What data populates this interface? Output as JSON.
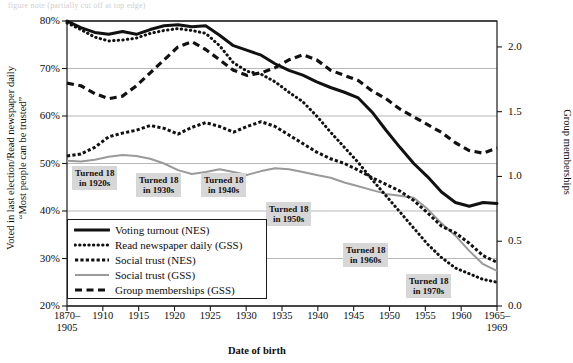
{
  "top_caption": "figure note (partially cut off at top edge)",
  "axes": {
    "left_label_line1": "Voted in last election/Read newspaper daily",
    "left_label_line2": "“Most people can be trusted”",
    "right_label": "Group memberships",
    "x_label": "Date of birth",
    "y_left_ticks": [
      "80%",
      "70%",
      "60%",
      "50%",
      "40%",
      "30%",
      "20%"
    ],
    "y_left_range": [
      20,
      80
    ],
    "y_right_ticks": [
      "2.0",
      "1.5",
      "1.0",
      "0.5",
      "0.0"
    ],
    "y_right_range": [
      0.0,
      2.2
    ],
    "x_ticks": [
      "1870–\n1905",
      "1910",
      "1915",
      "1920",
      "1925",
      "1930",
      "1935",
      "1940",
      "1945",
      "1950",
      "1955",
      "1960",
      "1965–\n1969"
    ]
  },
  "legend": {
    "items": [
      {
        "label": "Voting turnout (NES)",
        "style": "solid-thick",
        "color": "#111111"
      },
      {
        "label": "Read newspaper daily (GSS)",
        "style": "dotted",
        "color": "#111111"
      },
      {
        "label": "Social trust (NES)",
        "style": "dashed-short",
        "color": "#111111"
      },
      {
        "label": "Social trust (GSS)",
        "style": "solid-gray",
        "color": "#8d8d8d"
      },
      {
        "label": "Group memberships (GSS)",
        "style": "dashed-long",
        "color": "#111111"
      }
    ]
  },
  "annotations": [
    {
      "line1": "Turned 18",
      "line2": "in 1920s",
      "x": 72,
      "y": 166
    },
    {
      "line1": "Turned 18",
      "line2": "in 1930s",
      "x": 136,
      "y": 173
    },
    {
      "line1": "Turned 18",
      "line2": "in 1940s",
      "x": 201,
      "y": 173
    },
    {
      "line1": "Turned 18",
      "line2": "in 1950s",
      "x": 266,
      "y": 202
    },
    {
      "line1": "Turned 18",
      "line2": "in 1960s",
      "x": 343,
      "y": 243
    },
    {
      "line1": "Turned 18",
      "line2": "in 1970s",
      "x": 406,
      "y": 274
    }
  ],
  "chart_data": {
    "type": "line",
    "title": "",
    "xlabel": "Date of birth",
    "ylabel": "Voted in last election/Read newspaper daily; “Most people can be trusted”",
    "y2label": "Group memberships",
    "ylim": [
      20,
      80
    ],
    "y2lim": [
      0.0,
      2.2
    ],
    "grid": "horizontal",
    "legend_position": "inside-lower-left",
    "x": [
      1905,
      1907,
      1909,
      1911,
      1913,
      1915,
      1917,
      1919,
      1921,
      1923,
      1925,
      1927,
      1929,
      1931,
      1933,
      1935,
      1937,
      1939,
      1941,
      1943,
      1945,
      1947,
      1949,
      1951,
      1953,
      1955,
      1957,
      1959,
      1961,
      1963,
      1965,
      1967
    ],
    "series": [
      {
        "name": "Voting turnout (NES)",
        "axis": "left",
        "unit": "percent",
        "values": [
          80.0,
          78.6,
          77.6,
          77.2,
          77.8,
          77.2,
          78.2,
          79.0,
          79.2,
          78.8,
          79.0,
          77.0,
          74.8,
          73.8,
          72.8,
          71.0,
          69.6,
          68.6,
          67.2,
          66.0,
          65.0,
          63.8,
          60.8,
          57.0,
          53.4,
          50.0,
          47.2,
          44.0,
          41.8,
          41.0,
          41.8,
          41.6
        ]
      },
      {
        "name": "Read newspaper daily (GSS)",
        "axis": "left",
        "unit": "percent",
        "values": [
          79.6,
          78.2,
          76.6,
          75.8,
          76.0,
          76.4,
          77.4,
          78.0,
          78.4,
          78.0,
          77.4,
          74.8,
          71.2,
          69.4,
          68.8,
          67.2,
          65.0,
          63.0,
          60.0,
          56.6,
          53.4,
          50.2,
          46.6,
          43.2,
          39.8,
          36.4,
          33.0,
          30.2,
          28.0,
          26.8,
          25.6,
          25.0
        ]
      },
      {
        "name": "Social trust (NES)",
        "axis": "left",
        "unit": "percent",
        "values": [
          51.6,
          52.0,
          53.4,
          55.6,
          56.4,
          57.0,
          58.0,
          57.4,
          56.2,
          57.6,
          58.6,
          57.8,
          56.6,
          57.8,
          58.8,
          57.8,
          56.0,
          54.2,
          52.4,
          51.0,
          50.0,
          48.6,
          47.0,
          45.6,
          44.2,
          42.2,
          39.6,
          36.8,
          35.4,
          33.2,
          30.6,
          29.2
        ]
      },
      {
        "name": "Social trust (GSS)",
        "axis": "left",
        "unit": "percent",
        "values": [
          50.6,
          50.4,
          50.8,
          51.4,
          51.8,
          51.6,
          51.0,
          50.0,
          48.6,
          47.8,
          48.2,
          48.8,
          48.2,
          47.6,
          48.4,
          49.0,
          48.8,
          48.2,
          47.6,
          47.0,
          46.0,
          45.2,
          44.4,
          43.6,
          43.2,
          42.8,
          40.4,
          37.4,
          34.8,
          31.6,
          28.8,
          27.4
        ]
      },
      {
        "name": "Group memberships (GSS)",
        "axis": "right",
        "unit": "memberships",
        "values": [
          1.72,
          1.7,
          1.64,
          1.6,
          1.62,
          1.7,
          1.8,
          1.9,
          2.0,
          2.04,
          1.98,
          1.9,
          1.82,
          1.78,
          1.8,
          1.84,
          1.9,
          1.94,
          1.9,
          1.82,
          1.78,
          1.74,
          1.66,
          1.6,
          1.52,
          1.46,
          1.4,
          1.34,
          1.26,
          1.2,
          1.18,
          1.22
        ]
      }
    ]
  }
}
